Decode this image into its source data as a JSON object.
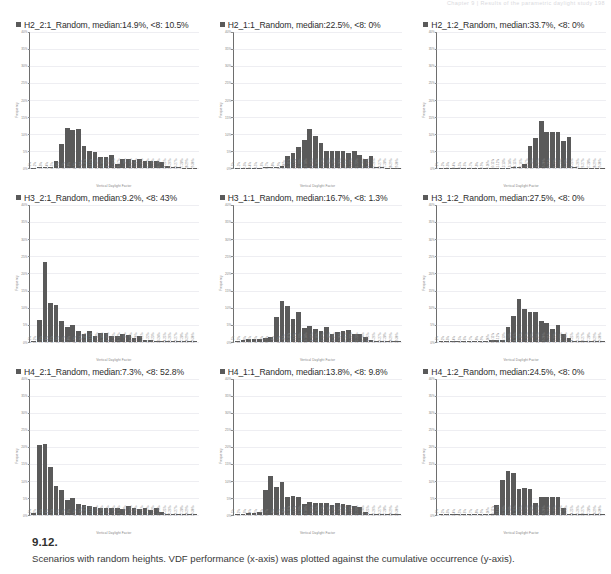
{
  "page": {
    "header_text": "Chapter 9  |  Results of the parametric daylight study        198"
  },
  "caption": {
    "number": "9.12.",
    "text": "Scenarios with random heights. VDF performance (x-axis) was plotted against the cumulative occurrence (y-axis)."
  },
  "common": {
    "xlabel": "Vertical Daylight Factor",
    "ylabel": "Frequency",
    "yticks": [
      "40%",
      "35%",
      "30%",
      "25%",
      "20%",
      "15%",
      "10%",
      "5%",
      "0%"
    ],
    "ylim": [
      0,
      40
    ],
    "xticks": [
      "0-1%",
      "1-2%",
      "2-3%",
      "3-4%",
      "4-5%",
      "5-6%",
      "6-7%",
      "7-8%",
      "8-9%",
      "9-10%",
      "10-11%",
      "11-12%",
      "12-13%",
      "13-14%",
      "14-15%",
      "15-16%",
      "16-17%",
      "17-18%",
      "18-19%",
      "19-20%",
      "20-21%",
      "21-22%",
      "22-23%",
      "23-24%",
      "24-25%",
      "25-26%",
      "26-27%",
      "27-28%",
      "28-29%",
      "29-30%"
    ],
    "legend_color": "#5a5a5a"
  },
  "chart_data": [
    {
      "type": "bar",
      "id": "H2_2_1",
      "title": "H2_2:1_Random,  median:14.9%,  <8: 10.5%",
      "series_name": "H2_2:1_Random",
      "median": "14.9%",
      "below8": "10.5%",
      "xlabel": "Vertical Daylight Factor",
      "ylabel": "Frequency",
      "ylim": [
        0,
        40
      ],
      "categories": [
        "0-1%",
        "1-2%",
        "2-3%",
        "3-4%",
        "4-5%",
        "5-6%",
        "6-7%",
        "7-8%",
        "8-9%",
        "9-10%",
        "10-11%",
        "11-12%",
        "12-13%",
        "13-14%",
        "14-15%",
        "15-16%",
        "16-17%",
        "17-18%",
        "18-19%",
        "19-20%",
        "20-21%",
        "21-22%",
        "22-23%",
        "23-24%",
        "24-25%",
        "25-26%",
        "26-27%",
        "27-28%",
        "28-29%",
        "29-30%"
      ],
      "values": [
        0.2,
        0.3,
        0.4,
        0.5,
        2.2,
        7.0,
        11.8,
        11.2,
        11.6,
        6.6,
        5.2,
        4.8,
        3.4,
        3.4,
        4.0,
        1.4,
        2.8,
        2.6,
        2.4,
        2.6,
        2.2,
        2.2,
        2.2,
        2.0,
        0.8,
        0.5,
        0.3,
        0.2,
        0.1,
        0.1
      ]
    },
    {
      "type": "bar",
      "id": "H2_1_1",
      "title": "H2_1:1_Random,  median:22.5%,  <8: 0%",
      "series_name": "H2_1:1_Random",
      "median": "22.5%",
      "below8": "0%",
      "xlabel": "Vertical Daylight Factor",
      "ylabel": "Frequency",
      "ylim": [
        0,
        40
      ],
      "categories": [
        "0-1%",
        "1-2%",
        "2-3%",
        "3-4%",
        "4-5%",
        "5-6%",
        "6-7%",
        "7-8%",
        "8-9%",
        "9-10%",
        "10-11%",
        "11-12%",
        "12-13%",
        "13-14%",
        "14-15%",
        "15-16%",
        "16-17%",
        "17-18%",
        "18-19%",
        "19-20%",
        "20-21%",
        "21-22%",
        "22-23%",
        "23-24%",
        "24-25%",
        "25-26%",
        "26-27%",
        "27-28%",
        "28-29%",
        "29-30%"
      ],
      "values": [
        0.1,
        0.1,
        0.1,
        0.2,
        0.2,
        0.3,
        0.3,
        0.4,
        0.6,
        3.6,
        4.6,
        6.2,
        8.4,
        11.4,
        9.6,
        7.4,
        5.2,
        5.2,
        5.2,
        5.2,
        4.6,
        5.2,
        4.0,
        2.6,
        3.6,
        0.4,
        0.3,
        0.2,
        0.1,
        0.1
      ]
    },
    {
      "type": "bar",
      "id": "H2_1_2",
      "title": "H2_1:2_Random,  median:33.7%,  <8: 0%",
      "series_name": "H2_1:2_Random",
      "median": "33.7%",
      "below8": "0%",
      "xlabel": "Vertical Daylight Factor",
      "ylabel": "Frequency",
      "ylim": [
        0,
        40
      ],
      "categories": [
        "0-1%",
        "1-2%",
        "2-3%",
        "3-4%",
        "4-5%",
        "5-6%",
        "6-7%",
        "7-8%",
        "8-9%",
        "9-10%",
        "10-11%",
        "11-12%",
        "12-13%",
        "13-14%",
        "14-15%",
        "15-16%",
        "16-17%",
        "17-18%",
        "18-19%",
        "19-20%",
        "20-21%",
        "21-22%",
        "22-23%",
        "23-24%",
        "24-25%",
        "25-26%",
        "26-27%",
        "27-28%",
        "28-29%",
        "29-30%"
      ],
      "values": [
        0.1,
        0.1,
        0.1,
        0.1,
        0.1,
        0.1,
        0.1,
        0.1,
        0.1,
        0.2,
        0.2,
        0.2,
        0.2,
        0.3,
        0.3,
        1.4,
        6.6,
        8.8,
        13.8,
        10.6,
        10.6,
        10.6,
        8.0,
        9.2,
        0.4,
        0.2,
        0.2,
        0.1,
        0.1,
        0.1
      ]
    },
    {
      "type": "bar",
      "id": "H3_2_1",
      "title": "H3_2:1_Random,  median:9.2%,  <8: 43%",
      "series_name": "H3_2:1_Random",
      "median": "9.2%",
      "below8": "43%",
      "xlabel": "Vertical Daylight Factor",
      "ylabel": "Frequency",
      "ylim": [
        0,
        40
      ],
      "categories": [
        "0-1%",
        "1-2%",
        "2-3%",
        "3-4%",
        "4-5%",
        "5-6%",
        "6-7%",
        "7-8%",
        "8-9%",
        "9-10%",
        "10-11%",
        "11-12%",
        "12-13%",
        "13-14%",
        "14-15%",
        "15-16%",
        "16-17%",
        "17-18%",
        "18-19%",
        "19-20%",
        "20-21%",
        "21-22%",
        "22-23%",
        "23-24%",
        "24-25%",
        "25-26%",
        "26-27%",
        "27-28%",
        "28-29%",
        "29-30%"
      ],
      "values": [
        0.3,
        6.4,
        23.4,
        11.2,
        10.8,
        6.2,
        4.2,
        4.8,
        3.0,
        2.2,
        3.2,
        1.6,
        2.4,
        2.4,
        1.6,
        1.8,
        2.2,
        2.0,
        1.2,
        1.8,
        0.6,
        0.4,
        0.3,
        0.2,
        0.1,
        0.1,
        0.1,
        0.1,
        0.1,
        0.1
      ]
    },
    {
      "type": "bar",
      "id": "H3_1_1",
      "title": "H3_1:1_Random,  median:16.7%,  <8: 1.3%",
      "series_name": "H3_1:1_Random",
      "median": "16.7%",
      "below8": "1.3%",
      "xlabel": "Vertical Daylight Factor",
      "ylabel": "Frequency",
      "ylim": [
        0,
        40
      ],
      "categories": [
        "0-1%",
        "1-2%",
        "2-3%",
        "3-4%",
        "4-5%",
        "5-6%",
        "6-7%",
        "7-8%",
        "8-9%",
        "9-10%",
        "10-11%",
        "11-12%",
        "12-13%",
        "13-14%",
        "14-15%",
        "15-16%",
        "16-17%",
        "17-18%",
        "18-19%",
        "19-20%",
        "20-21%",
        "21-22%",
        "22-23%",
        "23-24%",
        "24-25%",
        "25-26%",
        "26-27%",
        "27-28%",
        "28-29%",
        "29-30%"
      ],
      "values": [
        0.2,
        0.6,
        0.8,
        0.8,
        0.9,
        1.0,
        1.4,
        7.2,
        11.8,
        10.4,
        6.6,
        8.6,
        4.0,
        4.6,
        3.6,
        3.2,
        4.2,
        2.2,
        2.8,
        3.2,
        3.4,
        2.2,
        2.2,
        1.4,
        0.4,
        0.2,
        0.2,
        0.1,
        0.1,
        0.1
      ]
    },
    {
      "type": "bar",
      "id": "H3_1_2",
      "title": "H3_1:2_Random,  median:27.5%,  <8: 0%",
      "series_name": "H3_1:2_Random",
      "median": "27.5%",
      "below8": "0%",
      "xlabel": "Vertical Daylight Factor",
      "ylabel": "Frequency",
      "ylim": [
        0,
        40
      ],
      "categories": [
        "0-1%",
        "1-2%",
        "2-3%",
        "3-4%",
        "4-5%",
        "5-6%",
        "6-7%",
        "7-8%",
        "8-9%",
        "9-10%",
        "10-11%",
        "11-12%",
        "12-13%",
        "13-14%",
        "14-15%",
        "15-16%",
        "16-17%",
        "17-18%",
        "18-19%",
        "19-20%",
        "20-21%",
        "21-22%",
        "22-23%",
        "23-24%",
        "24-25%",
        "25-26%",
        "26-27%",
        "27-28%",
        "28-29%",
        "29-30%"
      ],
      "values": [
        0.2,
        0.2,
        0.2,
        0.2,
        0.2,
        0.2,
        0.2,
        0.3,
        0.3,
        0.4,
        0.5,
        0.5,
        4.2,
        7.6,
        12.4,
        9.6,
        8.8,
        8.8,
        6.0,
        5.6,
        3.6,
        5.0,
        2.2,
        1.2,
        0.3,
        0.2,
        0.1,
        0.1,
        0.1,
        0.1
      ]
    },
    {
      "type": "bar",
      "id": "H4_2_1",
      "title": "H4_2:1_Random,  median:7.3%,  <8: 52.8%",
      "series_name": "H4_2:1_Random",
      "median": "7.3%",
      "below8": "52.8%",
      "xlabel": "Vertical Daylight Factor",
      "ylabel": "Frequency",
      "ylim": [
        0,
        40
      ],
      "categories": [
        "0-1%",
        "1-2%",
        "2-3%",
        "3-4%",
        "4-5%",
        "5-6%",
        "6-7%",
        "7-8%",
        "8-9%",
        "9-10%",
        "10-11%",
        "11-12%",
        "12-13%",
        "13-14%",
        "14-15%",
        "15-16%",
        "16-17%",
        "17-18%",
        "18-19%",
        "19-20%",
        "20-21%",
        "21-22%",
        "22-23%",
        "23-24%",
        "24-25%",
        "25-26%",
        "26-27%",
        "27-28%",
        "28-29%",
        "29-30%"
      ],
      "values": [
        0.5,
        20.6,
        20.8,
        14.2,
        8.4,
        7.2,
        4.4,
        5.0,
        3.2,
        3.0,
        2.6,
        2.4,
        2.2,
        2.0,
        2.2,
        2.0,
        1.8,
        2.6,
        2.2,
        1.8,
        2.0,
        1.4,
        2.0,
        0.9,
        0.4,
        0.2,
        0.2,
        0.1,
        0.1,
        0.1
      ]
    },
    {
      "type": "bar",
      "id": "H4_1_1",
      "title": "H4_1:1_Random,  median:13.8%,  <8: 9.8%",
      "series_name": "H4_1:1_Random",
      "median": "13.8%",
      "below8": "9.8%",
      "xlabel": "Vertical Daylight Factor",
      "ylabel": "Frequency",
      "ylim": [
        0,
        40
      ],
      "categories": [
        "0-1%",
        "1-2%",
        "2-3%",
        "3-4%",
        "4-5%",
        "5-6%",
        "6-7%",
        "7-8%",
        "8-9%",
        "9-10%",
        "10-11%",
        "11-12%",
        "12-13%",
        "13-14%",
        "14-15%",
        "15-16%",
        "16-17%",
        "17-18%",
        "18-19%",
        "19-20%",
        "20-21%",
        "21-22%",
        "22-23%",
        "23-24%",
        "24-25%",
        "25-26%",
        "26-27%",
        "27-28%",
        "28-29%",
        "29-30%"
      ],
      "values": [
        0.3,
        0.4,
        0.5,
        0.6,
        0.8,
        7.4,
        11.4,
        8.2,
        9.8,
        5.4,
        5.6,
        5.4,
        3.2,
        3.8,
        3.6,
        3.4,
        3.6,
        3.0,
        3.4,
        3.2,
        2.8,
        2.6,
        2.4,
        1.0,
        0.4,
        0.3,
        0.2,
        0.2,
        0.1,
        0.1
      ]
    },
    {
      "type": "bar",
      "id": "H4_1_2",
      "title": "H4_1:2_Random,  median:24.5%,  <8: 0%",
      "series_name": "H4_1:2_Random",
      "median": "24.5%",
      "below8": "0%",
      "xlabel": "Vertical Daylight Factor",
      "ylabel": "Frequency",
      "ylim": [
        0,
        40
      ],
      "categories": [
        "0-1%",
        "1-2%",
        "2-3%",
        "3-4%",
        "4-5%",
        "5-6%",
        "6-7%",
        "7-8%",
        "8-9%",
        "9-10%",
        "10-11%",
        "11-12%",
        "12-13%",
        "13-14%",
        "14-15%",
        "15-16%",
        "16-17%",
        "17-18%",
        "18-19%",
        "19-20%",
        "20-21%",
        "21-22%",
        "22-23%",
        "23-24%",
        "24-25%",
        "25-26%",
        "26-27%",
        "27-28%",
        "28-29%",
        "29-30%"
      ],
      "values": [
        0.2,
        0.2,
        0.2,
        0.2,
        0.2,
        0.2,
        0.3,
        0.3,
        0.4,
        0.4,
        2.8,
        10.4,
        12.8,
        12.4,
        7.6,
        8.0,
        7.6,
        3.4,
        5.4,
        5.4,
        5.4,
        5.4,
        2.0,
        0.4,
        0.2,
        0.2,
        0.1,
        0.1,
        0.1,
        0.1
      ]
    }
  ]
}
